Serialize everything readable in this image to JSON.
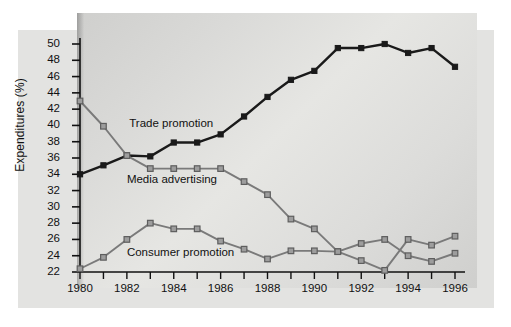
{
  "chart_data": {
    "type": "line",
    "title": "",
    "xlabel": "",
    "ylabel": "Expenditures (%)",
    "xlim": [
      1980,
      1996
    ],
    "ylim": [
      22,
      50
    ],
    "grid": false,
    "legend_position": "inline-annotations",
    "x": [
      1980,
      1981,
      1982,
      1983,
      1984,
      1985,
      1986,
      1987,
      1988,
      1989,
      1990,
      1991,
      1992,
      1993,
      1994,
      1995,
      1996
    ],
    "x_tick_labels": [
      "1980",
      "1982",
      "1984",
      "1986",
      "1988",
      "1990",
      "1992",
      "1994",
      "1996"
    ],
    "x_tick_values": [
      1980,
      1982,
      1984,
      1986,
      1988,
      1990,
      1992,
      1994,
      1996
    ],
    "y_tick_labels": [
      "22",
      "24",
      "26",
      "28",
      "30",
      "32",
      "34",
      "36",
      "38",
      "40",
      "42",
      "44",
      "46",
      "48",
      "50"
    ],
    "y_tick_values": [
      22,
      24,
      26,
      28,
      30,
      32,
      34,
      36,
      38,
      40,
      42,
      44,
      46,
      48,
      50
    ],
    "series": [
      {
        "name": "Trade promotion",
        "color": "#1a1a1a",
        "marker": "square",
        "label_x": 1982.1,
        "label_y": 40.0,
        "values": [
          34.0,
          35.1,
          36.3,
          36.2,
          37.9,
          37.9,
          38.9,
          41.1,
          43.5,
          45.6,
          46.7,
          49.5,
          49.5,
          50.0,
          48.9,
          49.5,
          47.2
        ]
      },
      {
        "name": "Media advertising",
        "color": "#7a7a7a",
        "marker": "square",
        "label_x": 1982.0,
        "label_y": 33.2,
        "values": [
          43.0,
          39.9,
          36.3,
          34.7,
          34.7,
          34.7,
          34.7,
          33.1,
          31.5,
          28.5,
          27.3,
          24.5,
          23.4,
          22.2,
          26.0,
          25.3,
          26.4
        ]
      },
      {
        "name": "Consumer promotion",
        "color": "#7a7a7a",
        "marker": "square",
        "label_x": 1982.0,
        "label_y": 24.2,
        "values": [
          22.4,
          23.8,
          26.0,
          28.0,
          27.3,
          27.3,
          25.8,
          24.8,
          23.6,
          24.6,
          24.6,
          24.5,
          25.5,
          26.0,
          24.0,
          23.3,
          24.3
        ]
      }
    ]
  }
}
